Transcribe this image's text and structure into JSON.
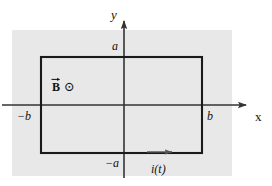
{
  "figure": {
    "background_color": "#ffffff",
    "panel_color": "#e8e8e8",
    "line_color": "#1a1a1a",
    "axis_color": "#333333"
  },
  "axes": {
    "y_axis_label": "y",
    "x_axis_label": "x",
    "y_tick_positive": "a",
    "y_tick_negative": "−a",
    "x_tick_positive": "b",
    "x_tick_negative": "−b"
  },
  "field": {
    "symbol_letter": "B",
    "direction_glyph": "⊙",
    "direction_meaning": "out-of-page-dot-icon"
  },
  "current": {
    "label": "i(t)",
    "direction": "rightward"
  }
}
